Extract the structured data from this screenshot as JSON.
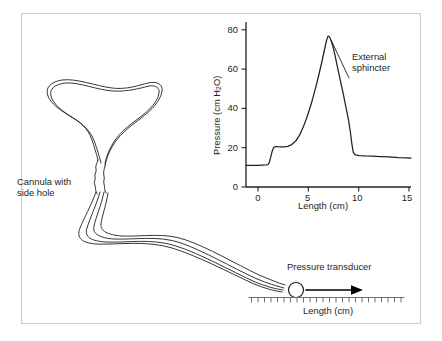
{
  "figure": {
    "background_color": "#ffffff",
    "border_color": "#c9c9c9",
    "ink_color": "#231f20"
  },
  "diagram": {
    "cannula_label_line1": "Cannula with",
    "cannula_label_line2": "side hole",
    "transducer_label": "Pressure transducer",
    "ruler_axis_label": "Length (cm)",
    "ruler_ticks": 24,
    "arrow_direction": "right"
  },
  "chart_data": {
    "type": "line",
    "title": "",
    "xlabel": "Length (cm)",
    "ylabel_prefix": "Pressure (cm H",
    "ylabel_sub": "2",
    "ylabel_suffix": "O)",
    "ylabel": "Pressure (cm H2O)",
    "xlim": [
      -1.2,
      15.4
    ],
    "ylim": [
      0,
      84
    ],
    "xticks": [
      0,
      5,
      10,
      15
    ],
    "xticklabels": [
      "0",
      "5",
      "10",
      "15"
    ],
    "yticks": [
      0,
      20,
      40,
      60,
      80
    ],
    "yticklabels": [
      "0",
      "20",
      "40",
      "60",
      "80"
    ],
    "grid": false,
    "legend": false,
    "annotations": [
      {
        "text_line1": "External",
        "text_line2": "sphincter",
        "text": "External sphincter",
        "points_to_x": 7.6,
        "points_to_y": 62
      }
    ],
    "series": [
      {
        "name": "Urethral pressure profile",
        "color": "#231f20",
        "x": [
          -1.2,
          -0.8,
          -0.4,
          0.0,
          0.4,
          0.8,
          1.0,
          1.15,
          1.3,
          1.45,
          1.6,
          1.8,
          2.0,
          2.3,
          2.6,
          3.0,
          3.4,
          3.8,
          4.2,
          4.6,
          5.0,
          5.4,
          5.8,
          6.1,
          6.4,
          6.7,
          6.9,
          7.05,
          7.2,
          7.4,
          7.6,
          7.8,
          8.0,
          8.3,
          8.6,
          8.9,
          9.1,
          9.3,
          9.45,
          9.6,
          9.8,
          10.2,
          10.8,
          11.5,
          12.3,
          13.2,
          14.1,
          15.0,
          15.4
        ],
        "y": [
          11.0,
          11.0,
          11.0,
          11.0,
          11.1,
          11.2,
          11.4,
          12.5,
          15.5,
          18.5,
          20.2,
          20.6,
          20.5,
          20.4,
          20.4,
          20.7,
          21.6,
          23.4,
          26.5,
          31.0,
          36.5,
          43.0,
          50.5,
          56.5,
          63.0,
          70.0,
          74.5,
          76.8,
          76.5,
          74.0,
          70.5,
          66.0,
          61.0,
          54.0,
          47.0,
          39.5,
          34.5,
          28.0,
          22.0,
          17.5,
          16.3,
          16.0,
          15.8,
          15.7,
          15.5,
          15.3,
          15.0,
          14.8,
          14.7
        ]
      }
    ]
  }
}
